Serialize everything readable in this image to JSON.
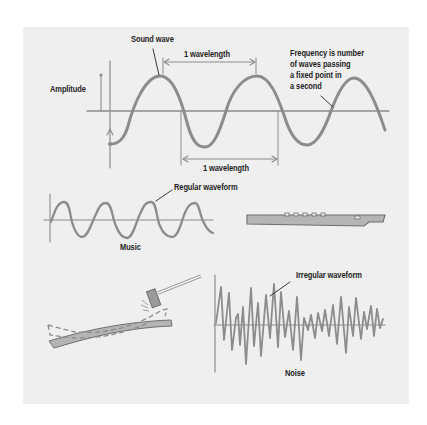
{
  "labels": {
    "sound_wave": "Sound wave",
    "wavelength_top": "1 wavelength",
    "wavelength_bottom": "1 wavelength",
    "amplitude": "Amplitude",
    "frequency_line1": "Frequency is number",
    "frequency_line2": "of waves passing",
    "frequency_line3": "a fixed point in",
    "frequency_line4": "a second",
    "regular_waveform": "Regular waveform",
    "music": "Music",
    "irregular_waveform": "Irregular waveform",
    "noise": "Noise"
  },
  "colors": {
    "background": "#ffffff",
    "panel": "#efefef",
    "wave_stroke": "#8c8c8c",
    "text": "#1e1e1e",
    "object_fill": "#b4b4b4"
  },
  "illustrations": {
    "flute": "flute-icon",
    "hammer": "hammer-icon",
    "vibrating_bar": "vibrating-metal-bar"
  }
}
